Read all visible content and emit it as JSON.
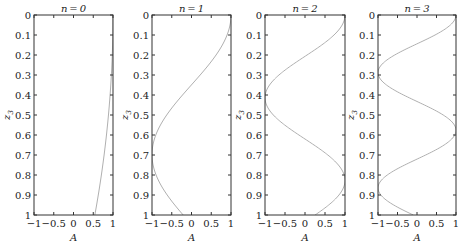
{
  "chart_data": [
    {
      "type": "line",
      "title": "n=0",
      "xlabel": "A",
      "ylabel": "z3",
      "xlim": [
        -1,
        1
      ],
      "ylim": [
        1,
        0
      ],
      "y_inverted": true,
      "xticks": [
        "−1",
        "−0.5",
        "0",
        "0.5",
        "1"
      ],
      "yticks": [
        "0",
        "0.1",
        "0.2",
        "0.3",
        "0.4",
        "0.5",
        "0.6",
        "0.7",
        "0.8",
        "0.9",
        "1"
      ],
      "grid": false,
      "series": [
        {
          "name": "n=0",
          "z": [
            0,
            0.1,
            0.2,
            0.3,
            0.4,
            0.5,
            0.6,
            0.7,
            0.8,
            0.9,
            1.0
          ],
          "A": [
            1.0,
            0.995,
            0.98,
            0.955,
            0.92,
            0.88,
            0.83,
            0.77,
            0.7,
            0.62,
            0.54
          ]
        }
      ]
    },
    {
      "type": "line",
      "title": "n=1",
      "xlabel": "A",
      "ylabel": "z3",
      "xlim": [
        -1,
        1
      ],
      "ylim": [
        1,
        0
      ],
      "y_inverted": true,
      "xticks": [
        "−1",
        "−0.5",
        "0",
        "0.5",
        "1"
      ],
      "yticks": [
        "0",
        "0.1",
        "0.2",
        "0.3",
        "0.4",
        "0.5",
        "0.6",
        "0.7",
        "0.8",
        "0.9",
        "1"
      ],
      "grid": false,
      "series": [
        {
          "name": "n=1",
          "z": [
            0,
            0.1,
            0.2,
            0.3,
            0.4,
            0.5,
            0.6,
            0.7,
            0.8,
            0.9,
            1.0
          ],
          "A": [
            1.0,
            0.9,
            0.62,
            0.22,
            -0.23,
            -0.63,
            -0.9,
            -1.0,
            -0.9,
            -0.62,
            -0.21
          ]
        }
      ]
    },
    {
      "type": "line",
      "title": "n=2",
      "xlabel": "A",
      "ylabel": "z3",
      "xlim": [
        -1,
        1
      ],
      "ylim": [
        1,
        0
      ],
      "y_inverted": true,
      "xticks": [
        "−1",
        "−0.5",
        "0",
        "0.5",
        "1"
      ],
      "yticks": [
        "0",
        "0.1",
        "0.2",
        "0.3",
        "0.4",
        "0.5",
        "0.6",
        "0.7",
        "0.8",
        "0.9",
        "1"
      ],
      "grid": false,
      "series": [
        {
          "name": "n=2",
          "z": [
            0,
            0.1,
            0.2,
            0.3,
            0.4,
            0.5,
            0.6,
            0.7,
            0.8,
            0.9,
            1.0
          ],
          "A": [
            1.0,
            0.73,
            0.07,
            -0.63,
            -1.0,
            -0.83,
            -0.21,
            0.52,
            0.98,
            0.9,
            0.35
          ]
        }
      ]
    },
    {
      "type": "line",
      "title": "n=3",
      "xlabel": "A",
      "ylabel": "z3",
      "xlim": [
        -1,
        1
      ],
      "ylim": [
        1,
        0
      ],
      "y_inverted": true,
      "xticks": [
        "−1",
        "−0.5",
        "0",
        "0.5",
        "1"
      ],
      "yticks": [
        "0",
        "0.1",
        "0.2",
        "0.3",
        "0.4",
        "0.5",
        "0.6",
        "0.7",
        "0.8",
        "0.9",
        "1"
      ],
      "grid": false,
      "series": [
        {
          "name": "n=3",
          "z": [
            0,
            0.1,
            0.2,
            0.3,
            0.4,
            0.5,
            0.6,
            0.7,
            0.8,
            0.9,
            1.0
          ],
          "A": [
            1.0,
            0.47,
            -0.55,
            -0.99,
            -0.38,
            0.63,
            0.97,
            0.29,
            -0.7,
            -0.94,
            -0.2
          ]
        }
      ]
    }
  ],
  "panels": [
    {
      "title": "n = 0",
      "k": 1.15
    },
    {
      "title": "n = 1",
      "k": 4.5
    },
    {
      "title": "n = 2",
      "k": 7.6
    },
    {
      "title": "n = 3",
      "k": 10.9
    }
  ],
  "axis": {
    "xlabel": "A",
    "ylabel": "z",
    "ylabel_sub": "3",
    "xticks": [
      {
        "v": -1,
        "t": "−1"
      },
      {
        "v": -0.5,
        "t": "−0.5"
      },
      {
        "v": 0,
        "t": "0"
      },
      {
        "v": 0.5,
        "t": "0.5"
      },
      {
        "v": 1,
        "t": "1"
      }
    ],
    "yticks": [
      "0",
      "0.1",
      "0.2",
      "0.3",
      "0.4",
      "0.5",
      "0.6",
      "0.7",
      "0.8",
      "0.9",
      "1"
    ]
  },
  "colors": {
    "curve": "#b0b0b0",
    "frame": "#333333",
    "text": "#222222"
  }
}
